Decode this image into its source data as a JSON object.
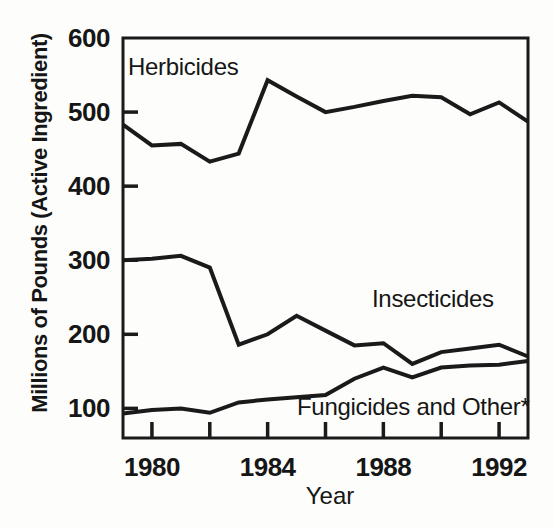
{
  "chart_data": {
    "type": "line",
    "title": "",
    "xlabel": "Year",
    "ylabel": "Millions of Pounds (Active Ingredient)",
    "x": [
      1979,
      1980,
      1981,
      1982,
      1983,
      1984,
      1985,
      1986,
      1987,
      1988,
      1989,
      1990,
      1991,
      1992,
      1993
    ],
    "series": [
      {
        "name": "Herbicides",
        "values": [
          483,
          455,
          457,
          433,
          444,
          543,
          521,
          500,
          507,
          515,
          522,
          520,
          497,
          513,
          487
        ]
      },
      {
        "name": "Insecticides",
        "values": [
          300,
          302,
          306,
          290,
          186,
          200,
          225,
          205,
          185,
          188,
          160,
          176,
          181,
          186,
          170
        ]
      },
      {
        "name": "Fungicides and Other*",
        "values": [
          93,
          98,
          100,
          94,
          108,
          112,
          115,
          118,
          140,
          155,
          142,
          155,
          158,
          159,
          164
        ]
      }
    ],
    "xlim": [
      1979,
      1993
    ],
    "ylim": [
      60,
      600
    ],
    "yticks": [
      100,
      200,
      300,
      400,
      500,
      600
    ],
    "xticks_minor": [
      1980,
      1982,
      1984,
      1986,
      1988,
      1990,
      1992
    ],
    "xticks_labeled": [
      1980,
      1984,
      1988,
      1992
    ],
    "grid": false,
    "legend_position": "inline-annotations",
    "line_color": "#1a1a1a",
    "text_color": "#161616",
    "background_color": "#fdfdfc"
  }
}
